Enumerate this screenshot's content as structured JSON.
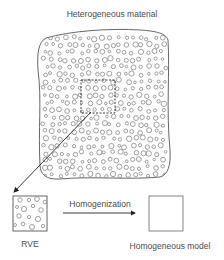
{
  "diagram": {
    "title": "Heterogeneous material",
    "rve_label": "RVE",
    "process_label": "Homogenization",
    "result_label": "Homogeneous model",
    "colors": {
      "stroke": "#555555",
      "particle": "#888888",
      "background": "#ffffff"
    },
    "nodes": [
      {
        "id": "heterogeneous-material",
        "label": "Heterogeneous material",
        "shape": "irregular-blob-with-particles"
      },
      {
        "id": "rve-window",
        "shape": "dashed-square",
        "parent": "heterogeneous-material"
      },
      {
        "id": "rve",
        "label": "RVE",
        "shape": "square-with-particles"
      },
      {
        "id": "homogeneous-model",
        "label": "Homogeneous model",
        "shape": "empty-square"
      }
    ],
    "edges": [
      {
        "from": "rve-window",
        "to": "rve",
        "label": ""
      },
      {
        "from": "rve",
        "to": "homogeneous-model",
        "label": "Homogenization"
      }
    ]
  }
}
